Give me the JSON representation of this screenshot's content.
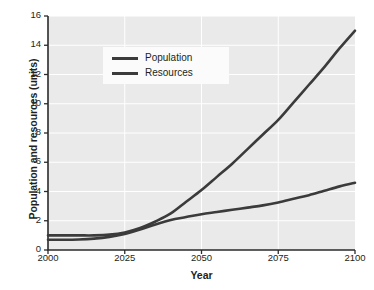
{
  "chart_data": {
    "type": "line",
    "title": "",
    "xlabel": "Year",
    "ylabel": "Population and resources (units)",
    "xlim": [
      2000,
      2100
    ],
    "ylim": [
      0,
      16
    ],
    "xticks": [
      2000,
      2025,
      2050,
      2075,
      2100
    ],
    "yticks": [
      0,
      2,
      4,
      6,
      8,
      10,
      12,
      14,
      16
    ],
    "grid": true,
    "legend_position": "upper left inside",
    "series": [
      {
        "name": "Population",
        "color": "#3b3b3b",
        "x": [
          2000,
          2005,
          2010,
          2015,
          2020,
          2025,
          2030,
          2035,
          2040,
          2045,
          2050,
          2055,
          2060,
          2065,
          2070,
          2075,
          2080,
          2085,
          2090,
          2095,
          2100
        ],
        "values": [
          1.0,
          1.0,
          1.0,
          1.0,
          1.05,
          1.2,
          1.5,
          1.95,
          2.5,
          3.3,
          4.1,
          5.0,
          5.9,
          6.9,
          7.9,
          8.9,
          10.1,
          11.3,
          12.5,
          13.8,
          15.0
        ]
      },
      {
        "name": "Resources",
        "color": "#3b3b3b",
        "x": [
          2000,
          2005,
          2010,
          2015,
          2020,
          2025,
          2030,
          2035,
          2040,
          2045,
          2050,
          2055,
          2060,
          2065,
          2070,
          2075,
          2080,
          2085,
          2090,
          2095,
          2100
        ],
        "values": [
          0.7,
          0.7,
          0.72,
          0.78,
          0.9,
          1.1,
          1.4,
          1.75,
          2.05,
          2.25,
          2.45,
          2.6,
          2.75,
          2.9,
          3.05,
          3.25,
          3.5,
          3.75,
          4.05,
          4.35,
          4.6
        ]
      }
    ]
  },
  "legend": {
    "entries": [
      {
        "label": "Population"
      },
      {
        "label": "Resources"
      }
    ]
  }
}
